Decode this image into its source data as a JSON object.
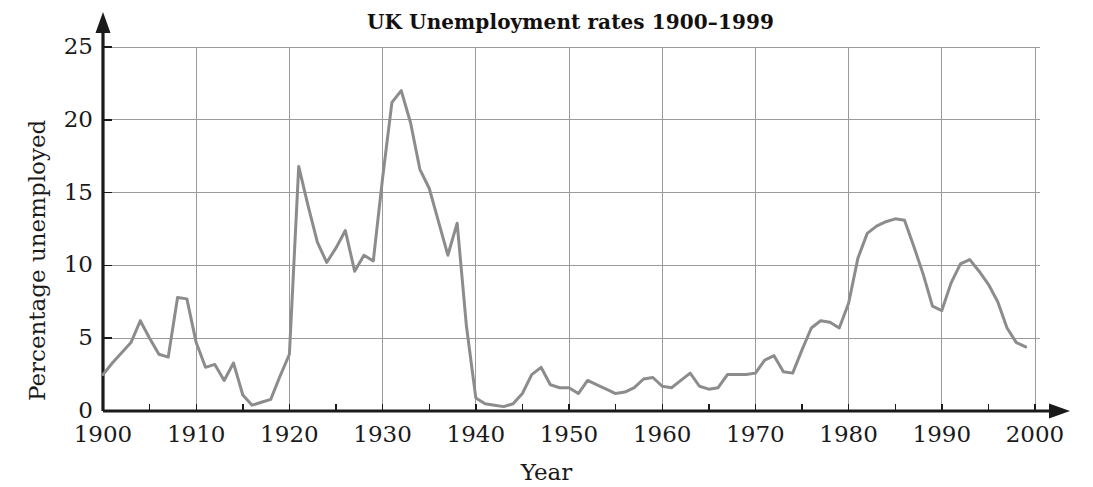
{
  "chart_data": {
    "type": "line",
    "title": "UK Unemployment rates 1900–1999",
    "xlabel": "Year",
    "ylabel": "Percentage unemployed",
    "xlim": [
      1900,
      2000
    ],
    "ylim": [
      0,
      25
    ],
    "xticks": [
      1900,
      1910,
      1920,
      1930,
      1940,
      1950,
      1960,
      1970,
      1980,
      1990,
      2000
    ],
    "xtick_labels": [
      "1900",
      "1910",
      "1920",
      "1930",
      "1940",
      "1950",
      "1960",
      "1970",
      "1980",
      "1990",
      "2000"
    ],
    "xminor_step": 5,
    "yticks": [
      0,
      5,
      10,
      15,
      20,
      25
    ],
    "ytick_labels": [
      "0",
      "5",
      "10",
      "15",
      "20",
      "25"
    ],
    "grid": "both",
    "grid_color": "#9a9a9a",
    "line_color": "#8c8c8c",
    "line_width": 3,
    "axis_color": "#1a1a1a",
    "legend": null,
    "series": [
      {
        "name": "UK unemployment rate",
        "x": [
          1900,
          1901,
          1902,
          1903,
          1904,
          1905,
          1906,
          1907,
          1908,
          1909,
          1910,
          1911,
          1912,
          1913,
          1914,
          1915,
          1916,
          1917,
          1918,
          1919,
          1920,
          1921,
          1922,
          1923,
          1924,
          1925,
          1926,
          1927,
          1928,
          1929,
          1930,
          1931,
          1932,
          1933,
          1934,
          1935,
          1936,
          1937,
          1938,
          1939,
          1940,
          1941,
          1942,
          1943,
          1944,
          1945,
          1946,
          1947,
          1948,
          1949,
          1950,
          1951,
          1952,
          1953,
          1954,
          1955,
          1956,
          1957,
          1958,
          1959,
          1960,
          1961,
          1962,
          1963,
          1964,
          1965,
          1966,
          1967,
          1968,
          1969,
          1970,
          1971,
          1972,
          1973,
          1974,
          1975,
          1976,
          1977,
          1978,
          1979,
          1980,
          1981,
          1982,
          1983,
          1984,
          1985,
          1986,
          1987,
          1988,
          1989,
          1990,
          1991,
          1992,
          1993,
          1994,
          1995,
          1996,
          1997,
          1998,
          1999
        ],
        "values": [
          2.5,
          3.3,
          4.0,
          4.7,
          6.2,
          5.0,
          3.9,
          3.7,
          7.8,
          7.7,
          4.7,
          3.0,
          3.2,
          2.1,
          3.3,
          1.1,
          0.4,
          0.6,
          0.8,
          2.4,
          3.9,
          16.8,
          14.1,
          11.6,
          10.2,
          11.2,
          12.4,
          9.6,
          10.7,
          10.3,
          16.0,
          21.2,
          22.0,
          19.8,
          16.6,
          15.3,
          13.0,
          10.7,
          12.9,
          5.8,
          0.9,
          0.5,
          0.4,
          0.3,
          0.5,
          1.2,
          2.5,
          3.0,
          1.8,
          1.6,
          1.6,
          1.2,
          2.1,
          1.8,
          1.5,
          1.2,
          1.3,
          1.6,
          2.2,
          2.3,
          1.7,
          1.6,
          2.1,
          2.6,
          1.7,
          1.5,
          1.6,
          2.5,
          2.5,
          2.5,
          2.6,
          3.5,
          3.8,
          2.7,
          2.6,
          4.2,
          5.7,
          6.2,
          6.1,
          5.7,
          7.4,
          10.5,
          12.2,
          12.7,
          13.0,
          13.2,
          13.1,
          11.3,
          9.4,
          7.2,
          6.9,
          8.8,
          10.1,
          10.4,
          9.6,
          8.7,
          7.5,
          5.7,
          4.7,
          4.4
        ]
      }
    ]
  },
  "axes": {
    "y_title": "Percentage unemployed",
    "x_title": "Year"
  }
}
